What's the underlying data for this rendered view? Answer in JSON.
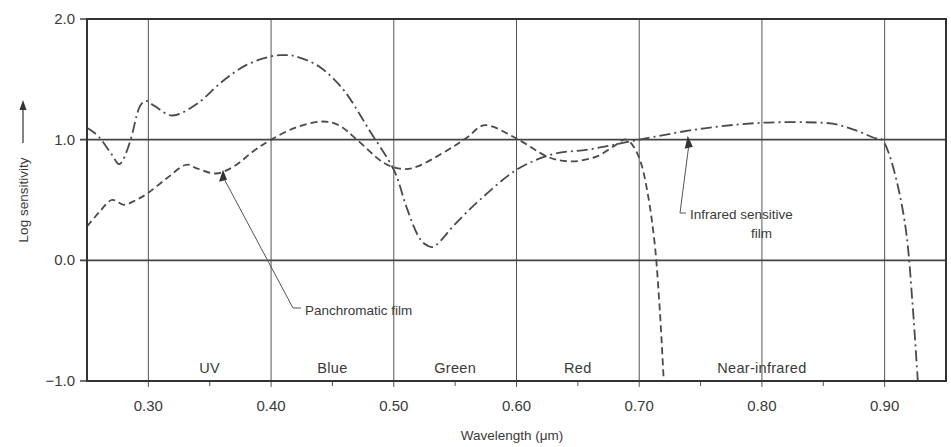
{
  "chart_data": {
    "type": "line",
    "title": "",
    "xlabel": "Wavelength (μm)",
    "ylabel": "Log sensitivity",
    "ylabel_arrow": "→",
    "xlim": [
      0.25,
      0.95
    ],
    "ylim": [
      -1.0,
      2.0
    ],
    "grid": true,
    "x_ticks": [
      0.3,
      0.4,
      0.5,
      0.6,
      0.7,
      0.8,
      0.9
    ],
    "x_tick_labels": [
      "0.30",
      "0.40",
      "0.50",
      "0.60",
      "0.70",
      "0.80",
      "0.90"
    ],
    "x_minor_ticks": [
      0.35,
      0.45,
      0.55,
      0.65,
      0.75,
      0.85
    ],
    "y_ticks": [
      2.0,
      1.0,
      0.0,
      -1.0
    ],
    "y_tick_labels": [
      "2.0",
      "1.0",
      "0.0",
      "−1.0"
    ],
    "bands": [
      {
        "label": "UV",
        "x": 0.35
      },
      {
        "label": "Blue",
        "x": 0.45
      },
      {
        "label": "Green",
        "x": 0.55
      },
      {
        "label": "Red",
        "x": 0.65
      },
      {
        "label": "Near-infrared",
        "x": 0.8
      }
    ],
    "series": [
      {
        "name": "Infrared sensitive film",
        "line_style": "dash-dot",
        "x": [
          0.25,
          0.26,
          0.27,
          0.277,
          0.285,
          0.292,
          0.298,
          0.305,
          0.32,
          0.34,
          0.36,
          0.38,
          0.4,
          0.41,
          0.42,
          0.44,
          0.46,
          0.48,
          0.5,
          0.51,
          0.52,
          0.528,
          0.535,
          0.55,
          0.57,
          0.6,
          0.63,
          0.66,
          0.7,
          0.75,
          0.8,
          0.85,
          0.87,
          0.89,
          0.9,
          0.91,
          0.918,
          0.923,
          0.927
        ],
        "y": [
          1.1,
          1.02,
          0.88,
          0.8,
          0.98,
          1.25,
          1.32,
          1.28,
          1.2,
          1.3,
          1.48,
          1.62,
          1.69,
          1.7,
          1.69,
          1.6,
          1.4,
          1.08,
          0.75,
          0.45,
          0.2,
          0.12,
          0.13,
          0.3,
          0.5,
          0.75,
          0.88,
          0.92,
          1.0,
          1.09,
          1.14,
          1.14,
          1.1,
          1.02,
          0.97,
          0.65,
          0.2,
          -0.4,
          -1.0
        ]
      },
      {
        "name": "Panchromatic film",
        "line_style": "dashed",
        "x": [
          0.25,
          0.26,
          0.27,
          0.28,
          0.29,
          0.3,
          0.315,
          0.33,
          0.34,
          0.355,
          0.37,
          0.385,
          0.4,
          0.42,
          0.44,
          0.455,
          0.47,
          0.49,
          0.505,
          0.52,
          0.545,
          0.56,
          0.575,
          0.6,
          0.625,
          0.645,
          0.665,
          0.68,
          0.69,
          0.7,
          0.707,
          0.713,
          0.717,
          0.72
        ],
        "y": [
          0.28,
          0.4,
          0.5,
          0.46,
          0.5,
          0.56,
          0.68,
          0.79,
          0.76,
          0.72,
          0.78,
          0.9,
          1.0,
          1.1,
          1.15,
          1.12,
          1.0,
          0.82,
          0.76,
          0.78,
          0.92,
          1.02,
          1.12,
          1.01,
          0.86,
          0.82,
          0.86,
          0.95,
          1.0,
          0.85,
          0.55,
          0.1,
          -0.45,
          -1.0
        ]
      }
    ],
    "annotations": [
      {
        "text": "Panchromatic film",
        "points_to": {
          "x": 0.36,
          "y": 0.76
        }
      },
      {
        "text_line1": "Infrared sensitive",
        "text_line2": "film",
        "points_to": {
          "x": 0.72,
          "y": 1.05
        }
      }
    ]
  }
}
